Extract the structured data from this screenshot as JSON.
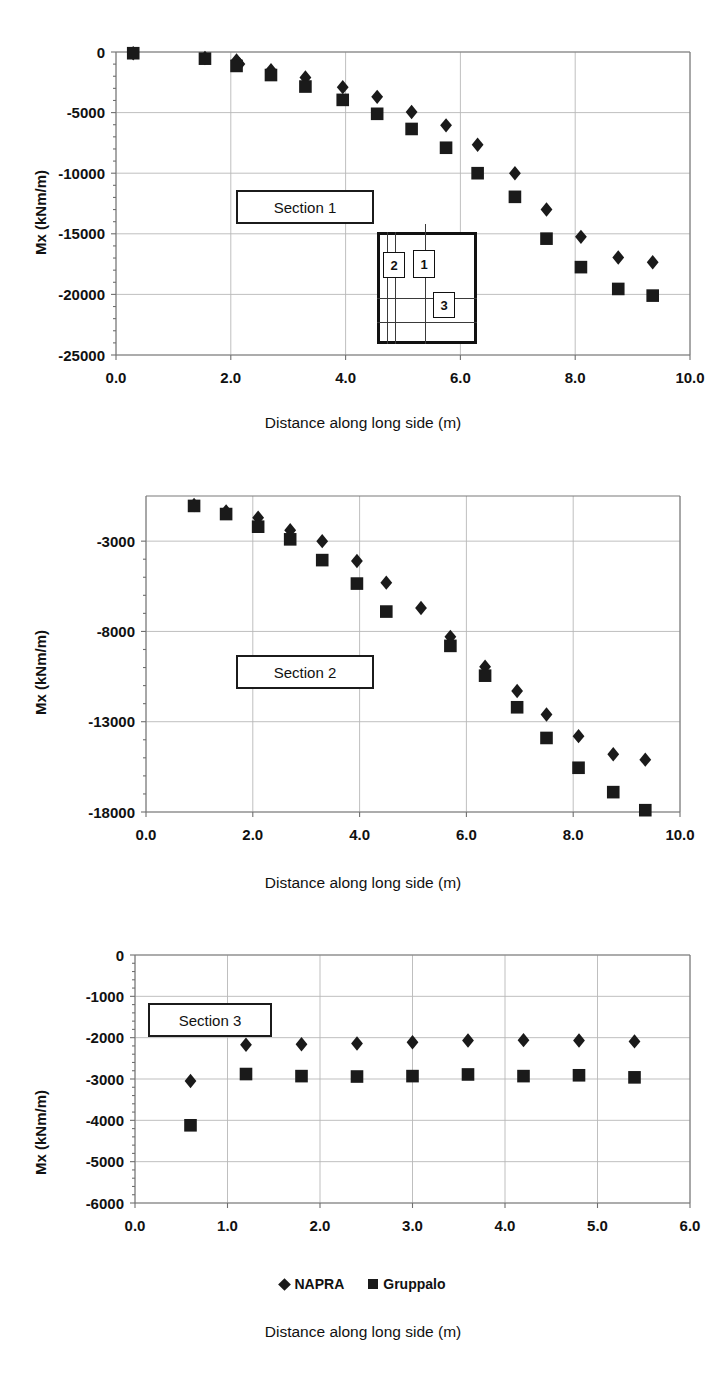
{
  "figure": {
    "marker_color": "#1a1a1a",
    "grid_color": "#b8b8b8",
    "axis_color": "#7a7a7a"
  },
  "legend": {
    "entries": [
      {
        "label": "NAPRA",
        "marker": "diamond-marker-icon"
      },
      {
        "label": "Gruppalo",
        "marker": "square-marker-icon"
      }
    ]
  },
  "inset": {
    "title": "foundation-plan-sketch",
    "tags": [
      "2",
      "1",
      "3"
    ]
  },
  "panels": [
    {
      "id": "panel-1",
      "section_label": "Section 1",
      "xlabel": "Distance along long side (m)",
      "ylabel": "Mx (kNm/m)"
    },
    {
      "id": "panel-2",
      "section_label": "Section 2",
      "xlabel": "Distance along long side (m)",
      "ylabel": "Mx (kNm/m)"
    },
    {
      "id": "panel-3",
      "section_label": "Section 3",
      "xlabel": "Distance along long side (m)",
      "ylabel": "Mx (kNm/m)"
    }
  ],
  "chart_data": [
    {
      "type": "scatter",
      "title": "Section 1",
      "xlabel": "Distance along long side (m)",
      "ylabel": "Mx (kNm/m)",
      "xlim": [
        0.0,
        10.0
      ],
      "ylim": [
        -25000,
        0
      ],
      "xticks": [
        0.0,
        2.0,
        4.0,
        6.0,
        8.0,
        10.0
      ],
      "xtick_labels": [
        "0.0",
        "2.0",
        "4.0",
        "6.0",
        "8.0",
        "10.0"
      ],
      "yticks": [
        0,
        -5000,
        -10000,
        -15000,
        -20000,
        -25000
      ],
      "ytick_labels": [
        "0",
        "-5000",
        "-10000",
        "-15000",
        "-20000",
        "-25000"
      ],
      "grid": true,
      "legend_position": "below-figure",
      "series": [
        {
          "name": "NAPRA",
          "marker": "diamond",
          "points": [
            [
              0.3,
              -100
            ],
            [
              1.55,
              -500
            ],
            [
              2.1,
              -700
            ],
            [
              2.15,
              -1000
            ],
            [
              2.7,
              -1500
            ],
            [
              3.3,
              -2100
            ],
            [
              3.95,
              -2900
            ],
            [
              4.55,
              -3700
            ],
            [
              5.15,
              -4950
            ],
            [
              5.75,
              -6050
            ],
            [
              6.3,
              -7650
            ],
            [
              6.95,
              -10000
            ],
            [
              7.5,
              -13000
            ],
            [
              8.1,
              -15250
            ],
            [
              8.75,
              -16950
            ],
            [
              9.35,
              -17350
            ]
          ]
        },
        {
          "name": "Gruppalo",
          "marker": "square",
          "points": [
            [
              0.3,
              -100
            ],
            [
              1.55,
              -550
            ],
            [
              2.1,
              -1150
            ],
            [
              2.7,
              -1900
            ],
            [
              3.3,
              -2850
            ],
            [
              3.95,
              -3950
            ],
            [
              4.55,
              -5100
            ],
            [
              5.15,
              -6350
            ],
            [
              5.75,
              -7900
            ],
            [
              6.3,
              -10000
            ],
            [
              6.95,
              -11950
            ],
            [
              7.5,
              -15400
            ],
            [
              8.1,
              -17750
            ],
            [
              8.75,
              -19550
            ],
            [
              9.35,
              -20100
            ]
          ]
        }
      ]
    },
    {
      "type": "scatter",
      "title": "Section 2",
      "xlabel": "Distance along long side (m)",
      "ylabel": "Mx (kNm/m)",
      "xlim": [
        0.0,
        10.0
      ],
      "ylim": [
        -18000,
        -500
      ],
      "xticks": [
        0.0,
        2.0,
        4.0,
        6.0,
        8.0,
        10.0
      ],
      "xtick_labels": [
        "0.0",
        "2.0",
        "4.0",
        "6.0",
        "8.0",
        "10.0"
      ],
      "yticks": [
        -3000,
        -8000,
        -13000,
        -18000
      ],
      "ytick_labels": [
        "-3000",
        "-8000",
        "-13000",
        "-18000"
      ],
      "grid": true,
      "legend_position": "below-figure",
      "series": [
        {
          "name": "NAPRA",
          "marker": "diamond",
          "points": [
            [
              0.9,
              -1000
            ],
            [
              1.5,
              -1350
            ],
            [
              2.1,
              -1700
            ],
            [
              2.7,
              -2400
            ],
            [
              3.3,
              -3000
            ],
            [
              3.95,
              -4100
            ],
            [
              4.5,
              -5300
            ],
            [
              5.15,
              -6700
            ],
            [
              5.7,
              -8300
            ],
            [
              6.35,
              -9950
            ],
            [
              6.95,
              -11300
            ],
            [
              7.5,
              -12600
            ],
            [
              8.1,
              -13800
            ],
            [
              8.75,
              -14800
            ],
            [
              9.35,
              -15100
            ]
          ]
        },
        {
          "name": "Gruppalo",
          "marker": "square",
          "points": [
            [
              0.9,
              -1050
            ],
            [
              1.5,
              -1500
            ],
            [
              2.1,
              -2200
            ],
            [
              2.7,
              -2900
            ],
            [
              3.3,
              -4050
            ],
            [
              3.95,
              -5350
            ],
            [
              4.5,
              -6900
            ],
            [
              5.7,
              -8800
            ],
            [
              6.35,
              -10450
            ],
            [
              6.95,
              -12200
            ],
            [
              7.5,
              -13900
            ],
            [
              8.1,
              -15550
            ],
            [
              8.75,
              -16900
            ],
            [
              9.35,
              -17900
            ]
          ]
        }
      ]
    },
    {
      "type": "scatter",
      "title": "Section 3",
      "xlabel": "Distance along long side (m)",
      "ylabel": "Mx (kNm/m)",
      "xlim": [
        0.0,
        6.0
      ],
      "ylim": [
        -6000,
        0
      ],
      "xticks": [
        0.0,
        1.0,
        2.0,
        3.0,
        4.0,
        5.0,
        6.0
      ],
      "xtick_labels": [
        "0.0",
        "1.0",
        "2.0",
        "3.0",
        "4.0",
        "5.0",
        "6.0"
      ],
      "yticks": [
        0,
        -1000,
        -2000,
        -3000,
        -4000,
        -5000,
        -6000
      ],
      "ytick_labels": [
        "0",
        "-1000",
        "-2000",
        "-3000",
        "-4000",
        "-5000",
        "-6000"
      ],
      "grid": true,
      "legend_position": "below-figure",
      "series": [
        {
          "name": "NAPRA",
          "marker": "diamond",
          "points": [
            [
              0.6,
              -3050
            ],
            [
              1.2,
              -2170
            ],
            [
              1.8,
              -2160
            ],
            [
              2.4,
              -2140
            ],
            [
              3.0,
              -2110
            ],
            [
              3.6,
              -2070
            ],
            [
              4.2,
              -2060
            ],
            [
              4.8,
              -2070
            ],
            [
              5.4,
              -2090
            ]
          ]
        },
        {
          "name": "Gruppalo",
          "marker": "square",
          "points": [
            [
              0.6,
              -4120
            ],
            [
              1.2,
              -2880
            ],
            [
              1.8,
              -2930
            ],
            [
              2.4,
              -2940
            ],
            [
              3.0,
              -2930
            ],
            [
              3.6,
              -2890
            ],
            [
              4.2,
              -2930
            ],
            [
              4.8,
              -2910
            ],
            [
              5.4,
              -2960
            ]
          ]
        }
      ]
    }
  ]
}
